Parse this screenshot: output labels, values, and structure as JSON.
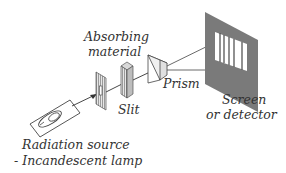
{
  "diagram": {
    "type": "spectrometer-schematic",
    "labels": {
      "absorbing_material_1": "Absorbing",
      "absorbing_material_2": "material",
      "slit": "Slit",
      "prism": "Prism",
      "screen_1": "Screen",
      "screen_2": "or detector",
      "source_1": "Radiation source",
      "source_2": "- Incandescent lamp"
    },
    "components": [
      "radiation-source",
      "slit",
      "absorbing-material",
      "prism",
      "screen"
    ],
    "colors": {
      "screen": "#7a7a7a",
      "hatch": "#8a8a8a",
      "line": "#333333"
    }
  }
}
